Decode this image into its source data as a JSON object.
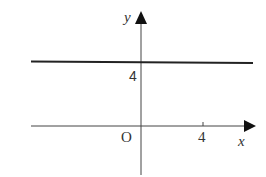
{
  "diagram": {
    "axes": {
      "x_label": "x",
      "y_label": "y",
      "origin_label": "O"
    },
    "ticks": {
      "x_tick_label": "4",
      "y_tick_label": "4"
    },
    "line": {
      "equation": "y = 4",
      "color": "#222222"
    }
  }
}
